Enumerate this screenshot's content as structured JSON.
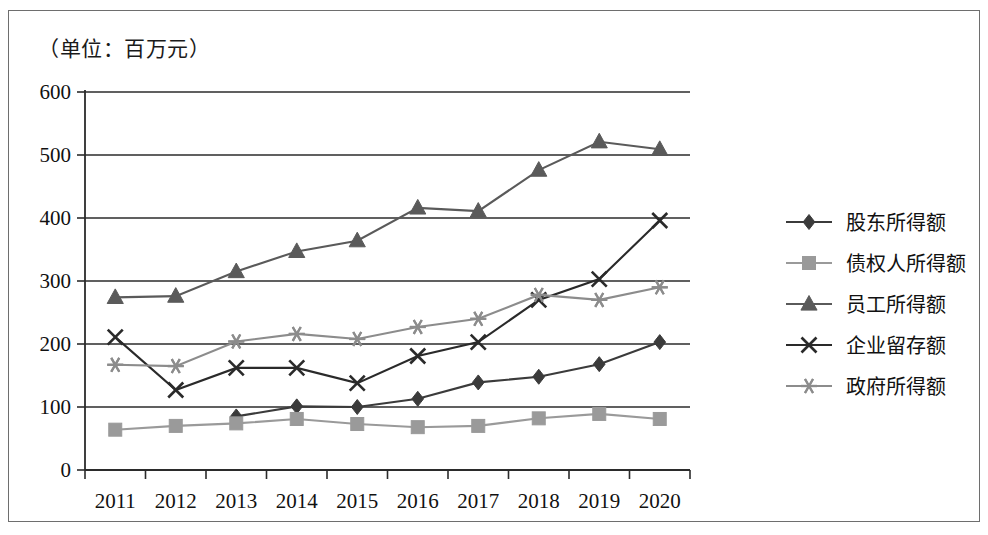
{
  "unit_note": "（单位：百万元）",
  "axes": {
    "y_ticks": [
      "0",
      "100",
      "200",
      "300",
      "400",
      "500",
      "600"
    ],
    "x_ticks": [
      "2011",
      "2012",
      "2013",
      "2014",
      "2015",
      "2016",
      "2017",
      "2018",
      "2019",
      "2020"
    ]
  },
  "legend": {
    "items": [
      {
        "label": "股东所得额",
        "marker": "diamond-marker",
        "color": "#3b3b3b"
      },
      {
        "label": "债权人所得额",
        "marker": "square-marker",
        "color": "#9a9a9a"
      },
      {
        "label": "员工所得额",
        "marker": "triangle-marker",
        "color": "#5a5a5a"
      },
      {
        "label": "企业留存额",
        "marker": "x-marker",
        "color": "#2a2a2a"
      },
      {
        "label": "政府所得额",
        "marker": "asterisk-marker",
        "color": "#8c8c8c"
      }
    ]
  },
  "chart_data": {
    "type": "line",
    "title": "",
    "subtitle": "（单位：百万元）",
    "xlabel": "",
    "ylabel": "百万元",
    "x": [
      "2011",
      "2012",
      "2013",
      "2014",
      "2015",
      "2016",
      "2017",
      "2018",
      "2019",
      "2020"
    ],
    "ylim": [
      0,
      600
    ],
    "ytick_step": 100,
    "grid": true,
    "legend_position": "right",
    "series": [
      {
        "name": "股东所得额",
        "marker": "diamond",
        "color": "#3b3b3b",
        "values": [
          null,
          null,
          85,
          101,
          100,
          113,
          139,
          148,
          168,
          203
        ]
      },
      {
        "name": "债权人所得额",
        "marker": "square",
        "color": "#9a9a9a",
        "values": [
          64,
          70,
          74,
          81,
          73,
          68,
          70,
          82,
          89,
          81
        ]
      },
      {
        "name": "员工所得额",
        "marker": "triangle",
        "color": "#5a5a5a",
        "values": [
          274,
          276,
          315,
          347,
          364,
          416,
          411,
          476,
          521,
          509
        ]
      },
      {
        "name": "企业留存额",
        "marker": "x",
        "color": "#2a2a2a",
        "values": [
          211,
          127,
          162,
          162,
          138,
          181,
          203,
          270,
          303,
          396
        ]
      },
      {
        "name": "政府所得额",
        "marker": "asterisk",
        "color": "#8c8c8c",
        "values": [
          167,
          165,
          204,
          216,
          208,
          227,
          240,
          278,
          270,
          290
        ]
      }
    ]
  }
}
